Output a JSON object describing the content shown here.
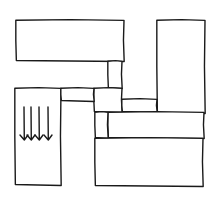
{
  "diagram": {
    "type": "floor-plan-sketch",
    "canvas": {
      "width": 218,
      "height": 203
    },
    "stroke_color": "#1a1a1a",
    "background": "#ffffff",
    "blocks": [
      {
        "id": "top-left-block",
        "x": 16,
        "y": 20,
        "w": 108,
        "h": 41
      },
      {
        "id": "top-right-block",
        "x": 157,
        "y": 20,
        "w": 48,
        "h": 93
      },
      {
        "id": "left-bottom-block",
        "x": 15,
        "y": 88,
        "w": 46,
        "h": 97
      },
      {
        "id": "upper-connector",
        "x": 108,
        "y": 61,
        "w": 14,
        "h": 27
      },
      {
        "id": "center-square",
        "x": 94,
        "y": 88,
        "w": 28,
        "h": 24
      },
      {
        "id": "left-connector-bar",
        "x": 61,
        "y": 88,
        "w": 33,
        "h": 13
      },
      {
        "id": "right-connector-strip",
        "x": 122,
        "y": 99,
        "w": 35,
        "h": 13
      },
      {
        "id": "middle-bar",
        "x": 108,
        "y": 112,
        "w": 96,
        "h": 26
      },
      {
        "id": "lower-connector",
        "x": 95,
        "y": 112,
        "w": 13,
        "h": 26
      },
      {
        "id": "bottom-right-block",
        "x": 95,
        "y": 138,
        "w": 108,
        "h": 48
      }
    ],
    "annotations": [
      {
        "id": "downward-arrows",
        "count": 4,
        "direction": "down",
        "within": "left-bottom-block",
        "x_positions": [
          24,
          31,
          39,
          48
        ],
        "y_start": 107,
        "y_end": 140
      }
    ]
  }
}
